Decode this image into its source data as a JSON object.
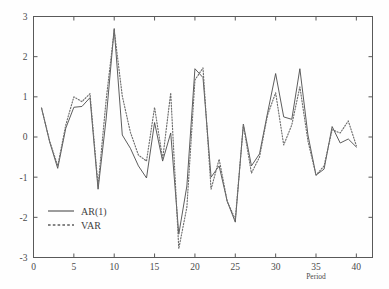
{
  "chart_data": {
    "type": "line",
    "title": "",
    "xlabel": "Period",
    "ylabel": "",
    "xlim": [
      0,
      42
    ],
    "ylim": [
      -3,
      3
    ],
    "grid": false,
    "legend_position": "lower-left",
    "x_ticks": [
      0,
      5,
      10,
      15,
      20,
      25,
      30,
      35,
      40
    ],
    "x_tick_labels": [
      "0",
      "5",
      "10",
      "15",
      "20",
      "25",
      "30",
      "35",
      "40"
    ],
    "y_ticks": [
      -3,
      -2,
      -1,
      0,
      1,
      2,
      3
    ],
    "y_tick_labels": [
      "-3",
      "-2",
      "-1",
      "0",
      "1",
      "2",
      "3"
    ],
    "x": [
      1,
      2,
      3,
      4,
      5,
      6,
      7,
      8,
      9,
      10,
      11,
      12,
      13,
      14,
      15,
      16,
      17,
      18,
      19,
      20,
      21,
      22,
      23,
      24,
      25,
      26,
      27,
      28,
      29,
      30,
      31,
      32,
      33,
      34,
      35,
      36,
      37,
      38,
      39,
      40
    ],
    "series": [
      {
        "name": "AR(1)",
        "style": "solid",
        "color": "#4b4b4b",
        "values": [
          0.72,
          -0.12,
          -0.78,
          0.22,
          0.74,
          0.76,
          0.98,
          -1.3,
          0.45,
          2.7,
          0.05,
          -0.28,
          -0.72,
          -1.02,
          0.36,
          -0.6,
          0.1,
          -2.42,
          -1.22,
          1.7,
          1.48,
          -1.0,
          -0.72,
          -1.6,
          -2.12,
          0.32,
          -0.72,
          -0.42,
          0.6,
          1.58,
          0.5,
          0.44,
          1.7,
          0.05,
          -0.95,
          -0.8,
          0.26,
          -0.15,
          -0.05,
          -0.25
        ]
      },
      {
        "name": "VAR",
        "style": "dashed",
        "color": "#6e6e6e",
        "values": [
          0.72,
          -0.1,
          -0.72,
          0.3,
          1.0,
          0.88,
          1.08,
          -1.22,
          0.92,
          2.66,
          1.02,
          0.12,
          -0.45,
          -0.6,
          0.74,
          -0.55,
          1.1,
          -2.78,
          -1.75,
          1.42,
          1.72,
          -1.3,
          -0.55,
          -1.6,
          -2.05,
          0.3,
          -0.9,
          -0.5,
          0.55,
          1.1,
          -0.2,
          0.3,
          1.25,
          -0.1,
          -0.95,
          -0.72,
          0.18,
          0.1,
          0.4,
          -0.22
        ]
      }
    ]
  },
  "legend": {
    "entries": [
      {
        "label": "AR(1)",
        "style": "solid"
      },
      {
        "label": "VAR",
        "style": "dashed"
      }
    ]
  }
}
